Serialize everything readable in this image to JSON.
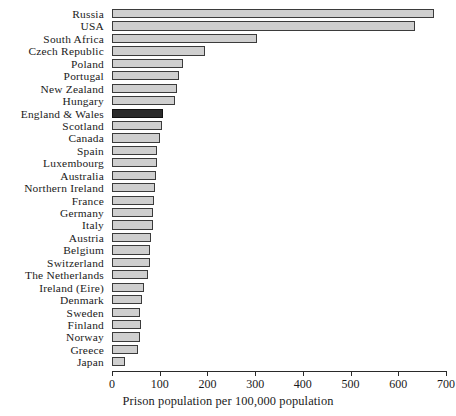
{
  "chart_data": {
    "type": "bar",
    "orientation": "horizontal",
    "title": "",
    "subtitle": "",
    "xlabel": "Prison population per 100,000 population",
    "ylabel": "",
    "xlim": [
      0,
      700
    ],
    "xticks": [
      0,
      100,
      200,
      300,
      400,
      500,
      600,
      700
    ],
    "xtick_labels": [
      "0",
      "100",
      "200",
      "300",
      "400",
      "500",
      "600",
      "700"
    ],
    "grid": false,
    "legend": false,
    "legend_position": "none",
    "highlight_category": "England & Wales",
    "colors": {
      "bar_fill": "#cfcfcf",
      "bar_edge": "#3b3b3b",
      "highlight_fill": "#2b2b2b",
      "highlight_edge": "#111111",
      "axis": "#2a2a2a",
      "text": "#1a1a1a",
      "background": "#ffffff"
    },
    "categories": [
      "Russia",
      "USA",
      "South Africa",
      "Czech Republic",
      "Poland",
      "Portugal",
      "New Zealand",
      "Hungary",
      "England & Wales",
      "Scotland",
      "Canada",
      "Spain",
      "Luxembourg",
      "Australia",
      "Northern Ireland",
      "France",
      "Germany",
      "Italy",
      "Austria",
      "Belgium",
      "Switzerland",
      "The Netherlands",
      "Ireland (Eire)",
      "Denmark",
      "Sweden",
      "Finland",
      "Norway",
      "Greece",
      "Japan"
    ],
    "values": [
      675,
      635,
      303,
      195,
      148,
      140,
      137,
      132,
      107,
      105,
      100,
      95,
      95,
      93,
      90,
      88,
      85,
      85,
      82,
      80,
      79,
      76,
      68,
      62,
      59,
      60,
      59,
      55,
      27
    ]
  }
}
